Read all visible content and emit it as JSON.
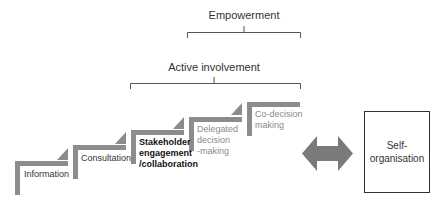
{
  "diagram": {
    "brackets": [
      {
        "label": "Empowerment"
      },
      {
        "label": "Active involvement"
      }
    ],
    "steps": [
      {
        "label": "Information",
        "style": "normal"
      },
      {
        "label": "Consultation",
        "style": "normal"
      },
      {
        "label_lines": [
          "Stakeholder",
          "engagement",
          "/collaboration"
        ],
        "style": "bold"
      },
      {
        "label_lines": [
          "Delegated",
          "decision",
          "-making"
        ],
        "style": "muted"
      },
      {
        "label_lines": [
          "Co-decision",
          "making"
        ],
        "style": "muted"
      }
    ],
    "connector": {
      "icon": "double-arrow-icon"
    },
    "self_organisation": {
      "label_lines": [
        "Self-",
        "organisation"
      ]
    },
    "colors": {
      "step_fill": "#8c8c8c",
      "arrow_fill": "#7a7a7a",
      "line": "#555555"
    }
  }
}
